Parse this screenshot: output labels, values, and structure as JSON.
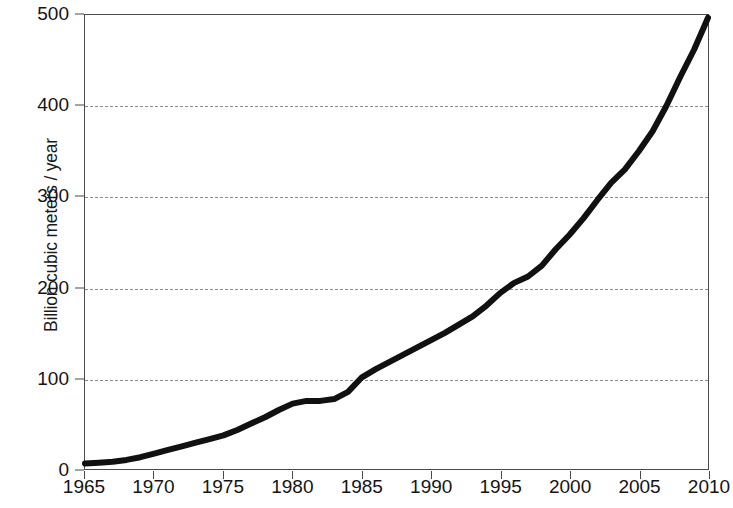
{
  "chart_data": {
    "type": "line",
    "title": "",
    "subtitle": "",
    "xlabel": "",
    "ylabel": "Billion cubic meters / year",
    "xlim": [
      1965,
      2010
    ],
    "ylim": [
      0,
      500
    ],
    "xticks": [
      1965,
      1970,
      1975,
      1980,
      1985,
      1990,
      1995,
      2000,
      2005,
      2010
    ],
    "xticklabels": [
      "1965",
      "1970",
      "1975",
      "1980",
      "1985",
      "1990",
      "1995",
      "2000",
      "2005",
      "2010"
    ],
    "yticks": [
      0,
      100,
      200,
      300,
      400,
      500
    ],
    "yticklabels": [
      "0",
      "100",
      "200",
      "300",
      "400",
      "500"
    ],
    "grid": "horizontal-dashed",
    "legend": null,
    "annotations": [],
    "line_color": "#111111",
    "line_width_px": 6,
    "grid_color": "#8c8c8c",
    "axis_color": "#4a4a4a",
    "background_color": "#ffffff",
    "series": [
      {
        "name": "Annual volume",
        "x": [
          1965,
          1966,
          1967,
          1968,
          1969,
          1970,
          1971,
          1972,
          1973,
          1974,
          1975,
          1976,
          1977,
          1978,
          1979,
          1980,
          1981,
          1982,
          1983,
          1984,
          1985,
          1986,
          1987,
          1988,
          1989,
          1990,
          1991,
          1992,
          1993,
          1994,
          1995,
          1996,
          1997,
          1998,
          1999,
          2000,
          2001,
          2002,
          2003,
          2004,
          2005,
          2006,
          2007,
          2008,
          2009,
          2010
        ],
        "values": [
          6,
          7,
          8,
          10,
          13,
          17,
          21,
          25,
          29,
          33,
          37,
          43,
          50,
          57,
          65,
          72,
          75,
          75,
          77,
          85,
          101,
          110,
          118,
          126,
          134,
          142,
          150,
          159,
          168,
          180,
          194,
          205,
          212,
          224,
          242,
          258,
          276,
          296,
          315,
          330,
          350,
          372,
          400,
          432,
          462,
          497
        ]
      }
    ]
  }
}
